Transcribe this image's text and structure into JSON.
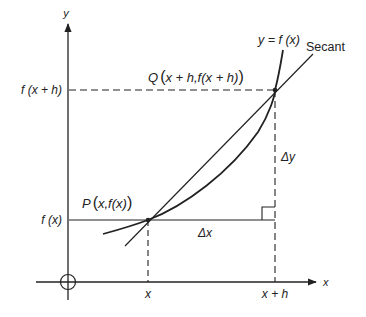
{
  "diagram": {
    "axis_labels": {
      "x": "x",
      "y": "y"
    },
    "curve_label": "y = f (x)",
    "secant_label": "Secant",
    "point_p_label": "P(x,f(x))",
    "point_p_parts": {
      "name": "P",
      "open": "(",
      "coords": "x,f(x)",
      "close": ")"
    },
    "point_q_label": "Q(x + h,f(x + h))",
    "point_q_parts": {
      "name": "Q",
      "open": "(",
      "coords": "x + h,f(x + h)",
      "close": ")"
    },
    "y_tick_labels": {
      "fx": "f (x)",
      "fxh": "f (x + h)"
    },
    "x_tick_labels": {
      "x": "x",
      "xh": "x + h"
    },
    "delta_x_label": "Δx",
    "delta_y_label": "Δy",
    "colors": {
      "ink": "#222222",
      "background": "#ffffff"
    }
  }
}
